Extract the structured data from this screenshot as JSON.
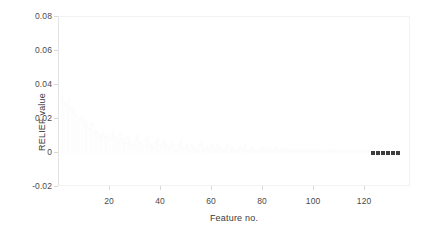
{
  "chart_data": {
    "type": "scatter",
    "title": "",
    "xlabel": "Feature no.",
    "ylabel": "RELIEF value",
    "xlim": [
      0,
      138
    ],
    "ylim": [
      -0.02,
      0.08
    ],
    "xticks": [
      20,
      40,
      60,
      80,
      100,
      120
    ],
    "yticks": [
      0.08,
      0.06,
      0.04,
      0.02,
      0,
      -0.02
    ],
    "ytick_labels": [
      "0.08",
      "0.06",
      "0.04",
      "0.02",
      "0",
      "-0.02"
    ],
    "xtick_labels": [
      "20",
      "40",
      "60",
      "80",
      "100",
      "120"
    ],
    "grid": false,
    "legend": null,
    "series": [
      {
        "name": "relief-values-faint",
        "color": "#fcfcfc",
        "marker": "square",
        "x": [
          1,
          2,
          3,
          4,
          5,
          6,
          7,
          8,
          9,
          10,
          11,
          12,
          13,
          14,
          15,
          16,
          17,
          18,
          19,
          20,
          21,
          22,
          23,
          24,
          25,
          26,
          27,
          28,
          29,
          30,
          31,
          32,
          33,
          34,
          35,
          36,
          37,
          38,
          39,
          40,
          41,
          42,
          43,
          44,
          45,
          46,
          47,
          48,
          49,
          50,
          51,
          52,
          53,
          54,
          55,
          56,
          57,
          58,
          59,
          60,
          61,
          62,
          63,
          64,
          65,
          66,
          67,
          68,
          69,
          70,
          71,
          72,
          73,
          74,
          75,
          76,
          77,
          78,
          79,
          80,
          81,
          82,
          83,
          84,
          85,
          86,
          87,
          88,
          89,
          90,
          91,
          92,
          93,
          94,
          95,
          96,
          97,
          98,
          99,
          100,
          101,
          102,
          103,
          104,
          105,
          106,
          107,
          108,
          109,
          110,
          111,
          112,
          113,
          114,
          115,
          116,
          117,
          118,
          119,
          120,
          121,
          122
        ],
        "y": [
          0.033,
          0.03,
          0.028,
          0.031,
          0.026,
          0.024,
          0.022,
          0.019,
          0.021,
          0.018,
          0.016,
          0.014,
          0.017,
          0.013,
          0.012,
          0.01,
          0.011,
          0.009,
          0.01,
          0.008,
          0.012,
          0.009,
          0.007,
          0.011,
          0.008,
          0.006,
          0.009,
          0.007,
          0.005,
          0.008,
          0.01,
          0.006,
          0.004,
          0.007,
          0.009,
          0.005,
          0.003,
          0.006,
          0.008,
          0.004,
          0.007,
          0.005,
          0.003,
          0.006,
          0.004,
          0.002,
          0.005,
          0.007,
          0.003,
          0.004,
          0.002,
          0.005,
          0.003,
          0.001,
          0.004,
          0.006,
          0.002,
          0.003,
          0.001,
          0.004,
          0.002,
          0.005,
          0.003,
          0.001,
          0.002,
          0.004,
          0.001,
          0.003,
          0.002,
          0.001,
          0.003,
          0.002,
          0.004,
          0.001,
          0.002,
          0.003,
          0.001,
          0.002,
          0.001,
          0.003,
          0.002,
          0.001,
          0.002,
          0.001,
          0.003,
          0.001,
          0.002,
          0.001,
          0.002,
          0.001,
          0.002,
          0.001,
          0.001,
          0.002,
          0.001,
          0.001,
          0.002,
          0.001,
          0.001,
          0.001,
          0.002,
          0.001,
          0.001,
          0.001,
          0.001,
          0.002,
          0.001,
          0.001,
          0.001,
          0.001,
          0.001,
          0.001,
          0.001,
          0.001,
          0.001,
          0.001,
          0.001,
          0.001,
          0.001,
          0.001,
          0.001,
          0.001
        ]
      },
      {
        "name": "relief-values-highlighted",
        "color": "#3d3d3d",
        "marker": "square",
        "x": [
          123,
          125,
          127,
          129,
          131,
          133
        ],
        "y": [
          0,
          0,
          0,
          0,
          0,
          0
        ]
      }
    ]
  }
}
